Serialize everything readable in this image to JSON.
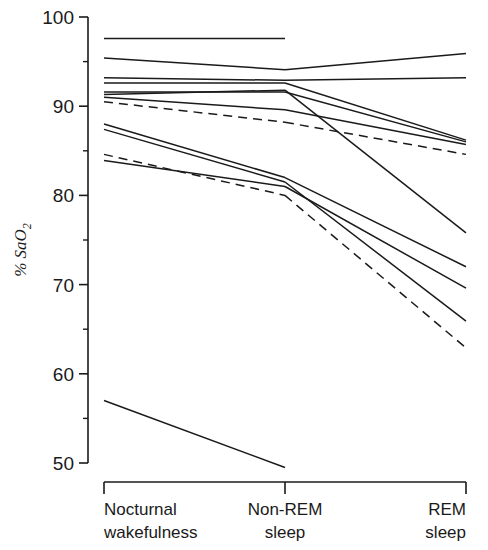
{
  "figure": {
    "background": "#ffffff",
    "line_color": "#1a1a1a"
  },
  "axis": {
    "ylabel_main": "% SaO",
    "ylabel_sub": "2",
    "ytick_labels": [
      "100",
      "90",
      "80",
      "70",
      "60",
      "50"
    ],
    "ymin": 50,
    "ymax": 100,
    "minor_tick_step": 5
  },
  "categories": [
    {
      "line1": "Nocturnal",
      "line2": "wakefulness"
    },
    {
      "line1": "Non-REM",
      "line2": "sleep"
    },
    {
      "line1": "REM",
      "line2": "sleep"
    }
  ],
  "chart_data": {
    "type": "line",
    "title": "",
    "xlabel": "",
    "ylabel": "% SaO2",
    "categories": [
      "Nocturnal wakefulness",
      "Non-REM sleep",
      "REM sleep"
    ],
    "x": [
      0,
      1,
      2
    ],
    "ylim": [
      50,
      100
    ],
    "grid": false,
    "legend": "none",
    "ytick_values": [
      100,
      90,
      80,
      70,
      60,
      50
    ],
    "minor_ticks": [
      95,
      85,
      75,
      65,
      55
    ],
    "series": [
      {
        "name": "subject-1",
        "style": "solid",
        "values": [
          97.6,
          97.6,
          null
        ]
      },
      {
        "name": "subject-2",
        "style": "solid",
        "values": [
          95.4,
          94.1,
          95.9
        ]
      },
      {
        "name": "subject-3",
        "style": "solid",
        "values": [
          93.2,
          92.9,
          93.2
        ]
      },
      {
        "name": "subject-4",
        "style": "solid",
        "values": [
          92.6,
          92.6,
          86.2
        ]
      },
      {
        "name": "subject-5",
        "style": "solid",
        "values": [
          91.6,
          91.6,
          86.0
        ]
      },
      {
        "name": "subject-6",
        "style": "solid",
        "values": [
          91.0,
          89.6,
          85.7
        ]
      },
      {
        "name": "subject-7",
        "style": "dashed",
        "values": [
          90.5,
          88.2,
          84.6
        ]
      },
      {
        "name": "subject-8",
        "style": "solid",
        "values": [
          87.4,
          81.5,
          65.9
        ]
      },
      {
        "name": "subject-9",
        "style": "dashed",
        "values": [
          84.6,
          80.0,
          62.9
        ]
      },
      {
        "name": "subject-10",
        "style": "solid",
        "values": [
          83.9,
          81.0,
          69.6
        ]
      },
      {
        "name": "subject-11",
        "style": "solid",
        "values": [
          91.3,
          91.8,
          75.8
        ]
      },
      {
        "name": "subject-12",
        "style": "solid",
        "values": [
          88.0,
          82.0,
          72.0
        ]
      },
      {
        "name": "subject-13",
        "style": "solid",
        "values": [
          57.0,
          49.5,
          null
        ]
      }
    ]
  },
  "geometry": {
    "plot_left": 104,
    "plot_right": 466,
    "x_positions": [
      104,
      285,
      466
    ],
    "y_top_px": 17,
    "y_bottom_px": 463,
    "axis_spine_x": 88,
    "bracket_y": 482,
    "bracket_tick_len": 12
  }
}
